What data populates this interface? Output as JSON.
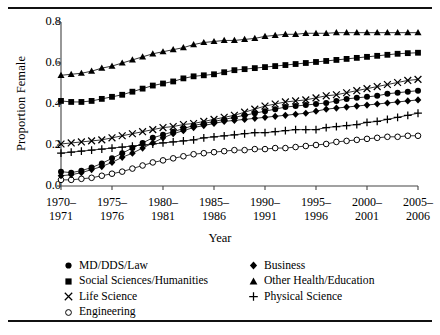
{
  "figure": {
    "has_top_rule": true,
    "has_bottom_rule": true
  },
  "axes": {
    "ylabel": "Proportion Female",
    "xlabel": "Year",
    "yticks": [
      "0.8",
      "0.6",
      "0.4",
      "0.2",
      "0.0"
    ],
    "xticks": [
      {
        "line1": "1970–",
        "line2": "1971"
      },
      {
        "line1": "1975–",
        "line2": "1976"
      },
      {
        "line1": "1980–",
        "line2": "1981"
      },
      {
        "line1": "1985–",
        "line2": "1986"
      },
      {
        "line1": "1990–",
        "line2": "1991"
      },
      {
        "line1": "1995–",
        "line2": "1996"
      },
      {
        "line1": "2000–",
        "line2": "2001"
      },
      {
        "line1": "2005–",
        "line2": "2006"
      }
    ]
  },
  "legend": {
    "left": [
      {
        "label": "MD/DDS/Law",
        "marker": "filled-circle-icon"
      },
      {
        "label": "Social Sciences/Humanities",
        "marker": "filled-square-icon"
      },
      {
        "label": "Life Science",
        "marker": "cross-x-icon"
      },
      {
        "label": "Engineering",
        "marker": "open-circle-icon"
      }
    ],
    "right": [
      {
        "label": "Business",
        "marker": "filled-diamond-icon"
      },
      {
        "label": "Other Health/Education",
        "marker": "filled-triangle-icon"
      },
      {
        "label": "Physical Science",
        "marker": "plus-icon"
      }
    ]
  },
  "chart_data": {
    "type": "line",
    "title": "",
    "xlabel": "Year",
    "ylabel": "Proportion Female",
    "ylim": [
      0.0,
      0.8
    ],
    "xlim": [
      1970,
      2005
    ],
    "grid": false,
    "legend_position": "below-plot-two-columns",
    "marker_color": "#000000",
    "line_color": "#000000",
    "x": [
      1970,
      1971,
      1972,
      1973,
      1974,
      1975,
      1976,
      1977,
      1978,
      1979,
      1980,
      1981,
      1982,
      1983,
      1984,
      1985,
      1986,
      1987,
      1988,
      1989,
      1990,
      1991,
      1992,
      1993,
      1994,
      1995,
      1996,
      1997,
      1998,
      1999,
      2000,
      2001,
      2002,
      2003,
      2004,
      2005
    ],
    "x_tick_labels": [
      "1970–1971",
      "1975–1976",
      "1980–1981",
      "1985–1986",
      "1990–1991",
      "1995–1996",
      "2000–2001",
      "2005–2006"
    ],
    "series": [
      {
        "name": "MD/DDS/Law",
        "marker": "filled-circle",
        "values": [
          0.07,
          0.065,
          0.075,
          0.09,
          0.11,
          0.135,
          0.16,
          0.185,
          0.21,
          0.235,
          0.25,
          0.265,
          0.28,
          0.295,
          0.305,
          0.315,
          0.325,
          0.335,
          0.345,
          0.355,
          0.365,
          0.375,
          0.385,
          0.39,
          0.395,
          0.4,
          0.405,
          0.415,
          0.425,
          0.43,
          0.435,
          0.44,
          0.45,
          0.455,
          0.46,
          0.465
        ]
      },
      {
        "name": "Social Sciences/Humanities",
        "marker": "filled-square",
        "values": [
          0.415,
          0.41,
          0.41,
          0.415,
          0.425,
          0.435,
          0.445,
          0.46,
          0.475,
          0.49,
          0.5,
          0.51,
          0.525,
          0.535,
          0.54,
          0.545,
          0.555,
          0.565,
          0.57,
          0.575,
          0.58,
          0.585,
          0.59,
          0.595,
          0.6,
          0.605,
          0.61,
          0.615,
          0.62,
          0.625,
          0.63,
          0.635,
          0.64,
          0.645,
          0.648,
          0.65
        ]
      },
      {
        "name": "Life Science",
        "marker": "cross-x",
        "values": [
          0.205,
          0.21,
          0.215,
          0.22,
          0.225,
          0.235,
          0.245,
          0.255,
          0.265,
          0.275,
          0.285,
          0.29,
          0.3,
          0.305,
          0.315,
          0.325,
          0.335,
          0.345,
          0.36,
          0.375,
          0.39,
          0.4,
          0.41,
          0.415,
          0.42,
          0.43,
          0.44,
          0.445,
          0.455,
          0.465,
          0.475,
          0.485,
          0.495,
          0.505,
          0.515,
          0.52
        ]
      },
      {
        "name": "Engineering",
        "marker": "open-circle",
        "values": [
          0.03,
          0.03,
          0.035,
          0.04,
          0.05,
          0.06,
          0.07,
          0.085,
          0.1,
          0.115,
          0.125,
          0.135,
          0.145,
          0.155,
          0.16,
          0.165,
          0.17,
          0.175,
          0.175,
          0.18,
          0.18,
          0.185,
          0.185,
          0.19,
          0.195,
          0.2,
          0.205,
          0.215,
          0.22,
          0.225,
          0.23,
          0.235,
          0.24,
          0.24,
          0.245,
          0.245
        ]
      },
      {
        "name": "Business",
        "marker": "filled-diamond",
        "values": [
          0.05,
          0.055,
          0.065,
          0.08,
          0.095,
          0.115,
          0.14,
          0.16,
          0.185,
          0.21,
          0.235,
          0.255,
          0.27,
          0.285,
          0.295,
          0.305,
          0.315,
          0.32,
          0.325,
          0.33,
          0.335,
          0.34,
          0.345,
          0.35,
          0.355,
          0.365,
          0.375,
          0.38,
          0.385,
          0.39,
          0.395,
          0.4,
          0.405,
          0.41,
          0.415,
          0.42
        ]
      },
      {
        "name": "Other Health/Education",
        "marker": "filled-triangle",
        "values": [
          0.54,
          0.545,
          0.55,
          0.56,
          0.575,
          0.585,
          0.6,
          0.615,
          0.63,
          0.645,
          0.655,
          0.665,
          0.675,
          0.69,
          0.7,
          0.705,
          0.71,
          0.71,
          0.715,
          0.72,
          0.73,
          0.735,
          0.74,
          0.74,
          0.745,
          0.745,
          0.745,
          0.748,
          0.748,
          0.748,
          0.748,
          0.748,
          0.748,
          0.748,
          0.748,
          0.748
        ]
      },
      {
        "name": "Physical Science",
        "marker": "plus",
        "values": [
          0.16,
          0.165,
          0.17,
          0.175,
          0.18,
          0.185,
          0.19,
          0.195,
          0.2,
          0.205,
          0.21,
          0.215,
          0.22,
          0.225,
          0.235,
          0.24,
          0.245,
          0.25,
          0.255,
          0.26,
          0.26,
          0.265,
          0.27,
          0.275,
          0.275,
          0.275,
          0.285,
          0.29,
          0.295,
          0.3,
          0.31,
          0.315,
          0.325,
          0.335,
          0.345,
          0.355
        ]
      }
    ]
  }
}
